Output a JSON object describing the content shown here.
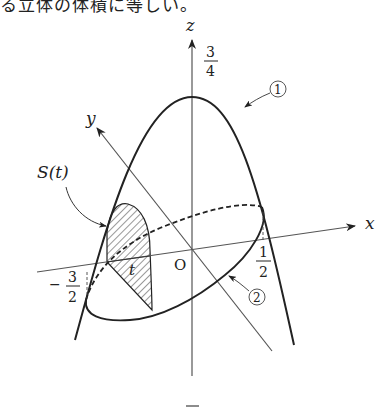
{
  "caption": "る立体の体積に等しい。",
  "diagram": {
    "axes": {
      "x_label": "x",
      "y_label": "y",
      "z_label": "z",
      "origin_label": "O"
    },
    "labels": {
      "z_intercept_num": "3",
      "z_intercept_den": "4",
      "x_intercept_num": "1",
      "x_intercept_den": "2",
      "x_neg_intercept_sign": "−",
      "x_neg_intercept_num": "3",
      "x_neg_intercept_den": "2",
      "section_label": "S(t)",
      "t_label": "t",
      "curve1_marker": "1",
      "curve2_marker": "2"
    },
    "curves": [
      {
        "id": "1",
        "description": "parabola in xz-plane"
      },
      {
        "id": "2",
        "description": "ellipse in xy-plane"
      }
    ],
    "shaded_region": "S(t)"
  }
}
